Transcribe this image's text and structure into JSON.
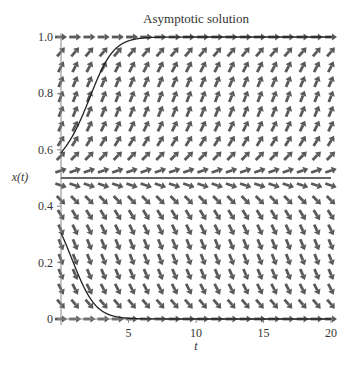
{
  "chart_data": {
    "type": "line",
    "subtype": "direction-field",
    "title": "Asymptotic solution",
    "xlabel": "t",
    "ylabel": "x(t)",
    "xlim": [
      0,
      20
    ],
    "ylim": [
      0,
      1
    ],
    "xticks": [
      5,
      10,
      15,
      20
    ],
    "xtick_labels": [
      "5",
      "10",
      "15",
      "20"
    ],
    "yticks": [
      0,
      0.2,
      0.4,
      0.6,
      0.8,
      1.0
    ],
    "ytick_labels": [
      "0",
      "0.2",
      "0.4",
      "0.6",
      "0.8",
      "1.0"
    ],
    "grid": false,
    "legend": null,
    "field": {
      "equation": "dx/dt = k*x*(1-x)*(2x-1)",
      "k": 1.25,
      "grid_cols": 20,
      "grid_rows": 20,
      "arrow_color": "#5a5a5a"
    },
    "equilibria": [
      {
        "x": 0,
        "stable": true
      },
      {
        "x": 0.5,
        "stable": false,
        "drawn_line": true
      },
      {
        "x": 1,
        "stable": true
      }
    ],
    "series": [
      {
        "name": "solution x(0)=0.59",
        "t": [
          0,
          1,
          2,
          3,
          4,
          5,
          6,
          7,
          8,
          10,
          15,
          20
        ],
        "x": [
          0.59,
          0.655,
          0.74,
          0.84,
          0.925,
          0.97,
          0.99,
          0.997,
          0.999,
          1.0,
          1.0,
          1.0
        ]
      },
      {
        "name": "solution x(0)=0.305",
        "t": [
          0,
          1,
          2,
          3,
          4,
          5,
          6,
          7,
          8,
          10,
          15,
          20
        ],
        "x": [
          0.305,
          0.21,
          0.125,
          0.06,
          0.022,
          0.007,
          0.002,
          0.0005,
          0.0001,
          0,
          0,
          0
        ]
      }
    ]
  }
}
